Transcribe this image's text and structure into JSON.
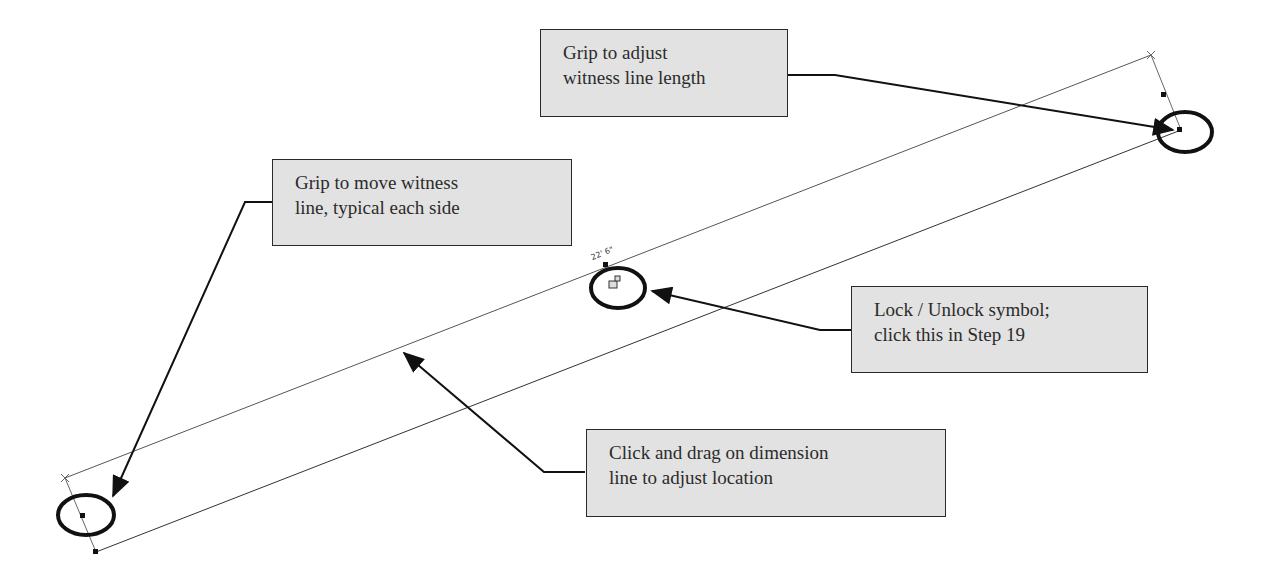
{
  "diagram": {
    "dimension_label": "22' 6\"",
    "callouts": [
      {
        "id": "witness-length",
        "lines": [
          "Grip to adjust",
          "witness line length"
        ]
      },
      {
        "id": "move-witness",
        "lines": [
          "Grip to move witness",
          "line, typical each side"
        ]
      },
      {
        "id": "lock-unlock",
        "lines": [
          "Lock / Unlock symbol;",
          "click this in Step 19"
        ]
      },
      {
        "id": "drag-dimension",
        "lines": [
          "Click and drag on dimension",
          "line to adjust location"
        ]
      }
    ],
    "colors": {
      "callout_fill": "#e2e2e2",
      "callout_border": "#2a2a2a",
      "leader": "#111111",
      "geometry_line": "#555555"
    }
  }
}
